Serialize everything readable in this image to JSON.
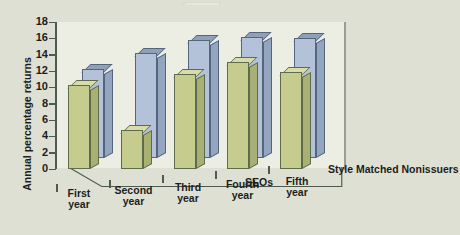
{
  "chart_data": {
    "type": "bar",
    "title": "",
    "xlabel": "",
    "ylabel": "Annual percentage returns",
    "ylim": [
      0,
      18
    ],
    "yticks": [
      0,
      2,
      4,
      6,
      8,
      10,
      12,
      14,
      16,
      18
    ],
    "grid": false,
    "legend_position": "depth-axis",
    "projection": "3d-grouped",
    "categories": [
      "First year",
      "Second year",
      "Third year",
      "Fourth year",
      "Fifth year"
    ],
    "categories_lines": [
      [
        "First",
        "year"
      ],
      [
        "Second",
        "year"
      ],
      [
        "Third",
        "year"
      ],
      [
        "Fourth",
        "year"
      ],
      [
        "Fifth",
        "year"
      ]
    ],
    "series": [
      {
        "name": "SEOs",
        "color": "#c5cc8d",
        "color_top": "#d7dca8",
        "color_side": "#a8b173",
        "values": [
          10.3,
          4.8,
          11.6,
          13.1,
          11.9
        ]
      },
      {
        "name": "Style Matched Nonissuers",
        "color": "#b3c2d8",
        "color_top": "#8fa0b8",
        "color_side": "#93a5bf",
        "values": [
          12.2,
          14.2,
          15.8,
          16.2,
          16.0
        ]
      }
    ]
  },
  "colors": {
    "background": "#dfe0d4",
    "plot_background": "#eceee3",
    "axis": "#4c5a50",
    "text": "#1d1d1b",
    "series_green": "#c5cc8d",
    "series_blue": "#b3c2d8"
  }
}
